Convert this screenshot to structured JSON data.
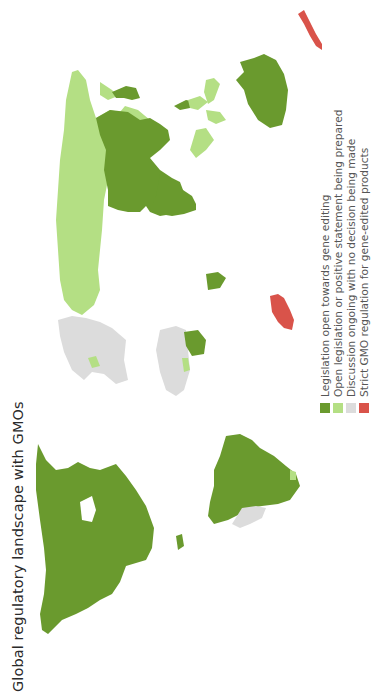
{
  "title": "Global regulatory landscape with GMOs",
  "orientation": "rotated 90deg counter-clockwise",
  "legend": {
    "items": [
      {
        "label": "Legislation open towards gene editing",
        "color": "#6a9a2e",
        "key": "open"
      },
      {
        "label": "Open legislation or positive statement being prepared",
        "color": "#b4df84",
        "key": "preparing"
      },
      {
        "label": "Discussion ongoing with no decision being made",
        "color": "#dcdcdc",
        "key": "discussion"
      },
      {
        "label": "Strict GMO regulation for gene-edited products",
        "color": "#d9534a",
        "key": "strict"
      }
    ]
  },
  "regions": {
    "open": [
      "North America",
      "South America (most)",
      "Russia",
      "China",
      "India",
      "Australia",
      "Japan",
      "Kenya"
    ],
    "preparing": [
      "Europe (EU)",
      "Southeast Asia",
      "Indonesia",
      "Western Africa"
    ],
    "discussion": [
      "Africa (most)",
      "Middle East",
      "Southern South America"
    ],
    "strict": [
      "New Zealand",
      "Madagascar"
    ]
  }
}
